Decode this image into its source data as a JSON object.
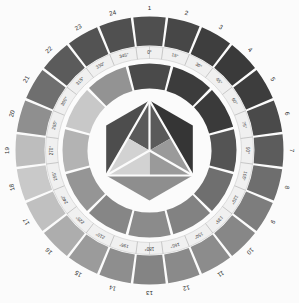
{
  "figure": {
    "background": "#fbfbfb"
  },
  "chart_data": {
    "type": "pie",
    "title": "",
    "xlabel": "",
    "ylabel": "",
    "legend": "none",
    "grid": false,
    "rings": [
      {
        "name": "outer-hue-ring",
        "segments": 24,
        "start_angle_deg": 0,
        "categories": [
          "1",
          "2",
          "3",
          "4",
          "5",
          "6",
          "7",
          "8",
          "9",
          "10",
          "11",
          "12",
          "13",
          "14",
          "15",
          "16",
          "17",
          "18",
          "19",
          "20",
          "21",
          "22",
          "23",
          "24"
        ],
        "values": [
          15,
          15,
          15,
          15,
          15,
          15,
          15,
          15,
          15,
          15,
          15,
          15,
          15,
          15,
          15,
          15,
          15,
          15,
          15,
          15,
          15,
          15,
          15,
          15
        ],
        "colors": [
          "#4f4f4f",
          "#474747",
          "#3e3e3e",
          "#3a3a3a",
          "#3d3d3d",
          "#4a4a4a",
          "#5c5c5c",
          "#6e6e6e",
          "#7d7d7d",
          "#878787",
          "#8c8c8c",
          "#8a8a8a",
          "#848484",
          "#8e8e8e",
          "#9b9b9b",
          "#adadad",
          "#c0c0c0",
          "#c9c9c9",
          "#bdbdbd",
          "#8f8f8f",
          "#6f6f6f",
          "#5b5b5b",
          "#535353",
          "#505050"
        ]
      },
      {
        "name": "degree-scale-ring",
        "segments": 24,
        "labels": [
          "0°",
          "15°",
          "30°",
          "45°",
          "60°",
          "75°",
          "90°",
          "105°",
          "120°",
          "135°",
          "150°",
          "165°",
          "180°",
          "195°",
          "210°",
          "225°",
          "240°",
          "255°",
          "270°",
          "285°",
          "300°",
          "315°",
          "330°",
          "345°"
        ],
        "color": "#f2f2f2"
      },
      {
        "name": "inner-hue-ring",
        "segments": 12,
        "values": [
          30,
          30,
          30,
          30,
          30,
          30,
          30,
          30,
          30,
          30,
          30,
          30
        ],
        "colors": [
          "#4a4a4a",
          "#3c3c3c",
          "#3a3a3a",
          "#545454",
          "#6f6f6f",
          "#828282",
          "#8b8b8b",
          "#868686",
          "#959595",
          "#b3b3b3",
          "#c8c8c8",
          "#939393"
        ]
      }
    ],
    "center": {
      "name": "hexagon-primary-diagram",
      "shape": "hexagon-with-inscribed-triangle",
      "regions": [
        {
          "name": "hex-corner-top-left",
          "color": "#4d4d4d"
        },
        {
          "name": "hex-corner-top-right",
          "color": "#353535"
        },
        {
          "name": "hex-corner-bottom",
          "color": "#8e8e8e"
        },
        {
          "name": "tri-top",
          "color": "#5a5a5a"
        },
        {
          "name": "tri-bottom-left",
          "color": "#d2d2d2"
        },
        {
          "name": "tri-bottom-right",
          "color": "#9a9a9a"
        }
      ]
    }
  },
  "outer_numbers": [
    "1",
    "2",
    "3",
    "4",
    "5",
    "6",
    "7",
    "8",
    "9",
    "10",
    "11",
    "12",
    "13",
    "14",
    "15",
    "16",
    "17",
    "18",
    "19",
    "20",
    "21",
    "22",
    "23",
    "24"
  ],
  "degree_labels": [
    "0°",
    "15°",
    "30°",
    "45°",
    "60°",
    "75°",
    "90°",
    "105°",
    "120°",
    "135°",
    "150°",
    "165°",
    "180°",
    "195°",
    "210°",
    "225°",
    "240°",
    "255°",
    "270°",
    "285°",
    "300°",
    "315°",
    "330°",
    "345°"
  ]
}
